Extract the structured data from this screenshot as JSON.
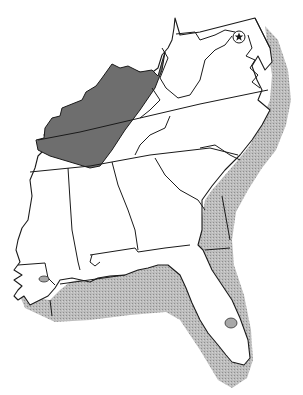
{
  "map": {
    "region": "Southeastern United States",
    "colors": {
      "background": "#ffffff",
      "land": "#ffffff",
      "outline": "#1a1a1a",
      "inland_range": "#6e6e6e",
      "coastal_range": "#b4b4b4"
    },
    "shaded_areas": [
      {
        "name": "inland-range",
        "shade": "dark"
      },
      {
        "name": "coastal-range",
        "shade": "light-stipple"
      }
    ],
    "markers": [
      {
        "name": "capital-star",
        "symbol": "star-in-circle"
      }
    ]
  }
}
